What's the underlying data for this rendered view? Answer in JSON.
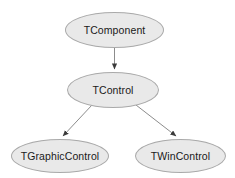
{
  "diagram": {
    "type": "class-inheritance-hierarchy",
    "background_color": "#ffffff",
    "node_fill_color": "#e9e9e9",
    "node_border_color": "#a9a9a9",
    "node_text_color": "#1a1a1a",
    "edge_color": "#666666",
    "nodes": [
      {
        "id": "tcomponent",
        "label": "TComponent"
      },
      {
        "id": "tcontrol",
        "label": "TControl"
      },
      {
        "id": "tgraphiccontrol",
        "label": "TGraphicControl"
      },
      {
        "id": "twincontrol",
        "label": "TWinControl"
      }
    ],
    "edges": [
      {
        "id": "edge-tcomponent-tcontrol",
        "from": "tcomponent",
        "to": "tcontrol",
        "style": "solid",
        "arrowhead": "filled-triangle"
      },
      {
        "id": "edge-tcontrol-tgraphiccontrol",
        "from": "tcontrol",
        "to": "tgraphiccontrol",
        "style": "solid",
        "arrowhead": "filled-triangle"
      },
      {
        "id": "edge-tcontrol-twincontrol",
        "from": "tcontrol",
        "to": "twincontrol",
        "style": "solid",
        "arrowhead": "filled-triangle"
      }
    ]
  }
}
